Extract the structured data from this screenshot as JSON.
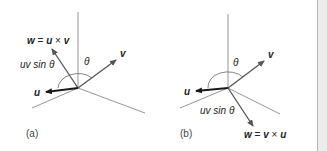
{
  "figure": {
    "panels": [
      {
        "caption": "(a)",
        "w_label_w": "w",
        "w_label_eq": " = ",
        "w_label_a": "u",
        "w_label_x": " × ",
        "w_label_b": "v",
        "magnitude_label": "uv sin θ",
        "theta_label": "θ",
        "u_label": "u",
        "v_label": "v"
      },
      {
        "caption": "(b)",
        "w_label_w": "w",
        "w_label_eq": " = ",
        "w_label_a": "v",
        "w_label_x": " × ",
        "w_label_b": "u",
        "magnitude_label": "uv sin θ",
        "theta_label": "θ",
        "u_label": "u",
        "v_label": "v"
      }
    ],
    "colors": {
      "axis": "#8a8a8a",
      "vector_u": "#1a1a1a",
      "vector_v": "#555555",
      "vector_w": "#555555",
      "text": "#222222"
    }
  }
}
